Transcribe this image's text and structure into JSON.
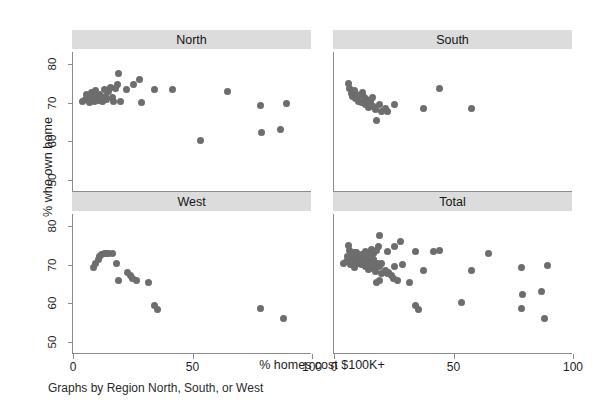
{
  "chart_data": {
    "type": "scatter",
    "title": "",
    "xlabel": "% homes cost $100K+",
    "ylabel": "% who own home",
    "note": "Graphs by Region North, South, or West",
    "xlim": [
      0,
      100
    ],
    "ylim": [
      47,
      83
    ],
    "xticks": [
      0,
      50,
      100
    ],
    "xticklabels": [
      "0",
      "50",
      "100"
    ],
    "yticks": [
      50,
      60,
      70,
      80
    ],
    "yticklabels": [
      "50",
      "60",
      "70",
      "80"
    ],
    "grid": false,
    "legend": "none",
    "marker_color": "#6d6d6d",
    "strip_color": "#dcdcdc",
    "axis_color": "#8c8c8c",
    "panels": [
      {
        "id": "north",
        "label": "North",
        "row": 0,
        "col": 0,
        "points": [
          [
            4.0,
            70.2
          ],
          [
            5.2,
            70.8
          ],
          [
            5.8,
            72.0
          ],
          [
            6.5,
            71.2
          ],
          [
            7.0,
            70.0
          ],
          [
            7.6,
            72.6
          ],
          [
            8.2,
            71.4
          ],
          [
            8.8,
            70.4
          ],
          [
            9.5,
            73.0
          ],
          [
            10.0,
            71.8
          ],
          [
            10.6,
            70.6
          ],
          [
            11.2,
            72.2
          ],
          [
            11.8,
            71.0
          ],
          [
            12.4,
            70.2
          ],
          [
            13.0,
            73.4
          ],
          [
            13.6,
            71.6
          ],
          [
            14.2,
            70.8
          ],
          [
            15.0,
            72.8
          ],
          [
            15.8,
            74.0
          ],
          [
            16.4,
            71.2
          ],
          [
            17.0,
            70.4
          ],
          [
            17.8,
            73.6
          ],
          [
            18.6,
            74.6
          ],
          [
            19.2,
            77.5
          ],
          [
            20.0,
            70.2
          ],
          [
            22.5,
            73.4
          ],
          [
            25.5,
            74.6
          ],
          [
            28.0,
            76.0
          ],
          [
            28.6,
            69.9
          ],
          [
            34.0,
            73.4
          ],
          [
            41.5,
            73.3
          ],
          [
            53.5,
            60.2
          ],
          [
            64.5,
            72.8
          ],
          [
            78.5,
            69.2
          ],
          [
            79.0,
            62.3
          ],
          [
            87.0,
            63.0
          ],
          [
            89.5,
            69.8
          ]
        ]
      },
      {
        "id": "south",
        "label": "South",
        "row": 0,
        "col": 1,
        "points": [
          [
            6.0,
            74.8
          ],
          [
            6.6,
            73.6
          ],
          [
            7.2,
            72.4
          ],
          [
            7.8,
            71.6
          ],
          [
            8.4,
            73.0
          ],
          [
            9.0,
            71.0
          ],
          [
            9.6,
            72.2
          ],
          [
            10.2,
            70.4
          ],
          [
            10.8,
            71.8
          ],
          [
            11.4,
            70.0
          ],
          [
            12.0,
            72.6
          ],
          [
            12.6,
            71.2
          ],
          [
            13.2,
            69.6
          ],
          [
            13.8,
            70.8
          ],
          [
            14.4,
            68.8
          ],
          [
            15.2,
            70.2
          ],
          [
            16.0,
            71.4
          ],
          [
            16.6,
            69.0
          ],
          [
            17.4,
            68.2
          ],
          [
            17.8,
            65.4
          ],
          [
            19.2,
            69.4
          ],
          [
            20.0,
            67.8
          ],
          [
            21.5,
            68.4
          ],
          [
            22.5,
            67.6
          ],
          [
            25.5,
            69.6
          ],
          [
            37.5,
            68.6
          ],
          [
            44.0,
            73.6
          ],
          [
            57.5,
            68.6
          ]
        ]
      },
      {
        "id": "west",
        "label": "West",
        "row": 1,
        "col": 0,
        "points": [
          [
            8.5,
            69.2
          ],
          [
            9.5,
            70.4
          ],
          [
            10.5,
            71.4
          ],
          [
            11.2,
            72.2
          ],
          [
            12.0,
            72.6
          ],
          [
            13.0,
            72.8
          ],
          [
            14.0,
            72.9
          ],
          [
            15.0,
            72.9
          ],
          [
            16.5,
            72.8
          ],
          [
            18.0,
            70.2
          ],
          [
            19.0,
            65.9
          ],
          [
            23.0,
            68.0
          ],
          [
            24.0,
            67.2
          ],
          [
            25.0,
            66.4
          ],
          [
            26.5,
            66.0
          ],
          [
            31.5,
            65.4
          ],
          [
            34.0,
            59.4
          ],
          [
            35.5,
            58.4
          ],
          [
            78.5,
            58.6
          ],
          [
            88.0,
            56.1
          ]
        ]
      },
      {
        "id": "total",
        "label": "Total",
        "row": 1,
        "col": 1,
        "points": [
          [
            4.0,
            70.2
          ],
          [
            5.2,
            70.8
          ],
          [
            5.8,
            72.0
          ],
          [
            6.0,
            74.8
          ],
          [
            6.5,
            71.2
          ],
          [
            6.6,
            73.6
          ],
          [
            7.0,
            70.0
          ],
          [
            7.2,
            72.4
          ],
          [
            7.6,
            72.6
          ],
          [
            7.8,
            71.6
          ],
          [
            8.2,
            71.4
          ],
          [
            8.4,
            73.0
          ],
          [
            8.5,
            69.2
          ],
          [
            8.8,
            70.4
          ],
          [
            9.0,
            71.0
          ],
          [
            9.5,
            73.0
          ],
          [
            9.5,
            70.4
          ],
          [
            9.6,
            72.2
          ],
          [
            10.0,
            71.8
          ],
          [
            10.2,
            70.4
          ],
          [
            10.5,
            71.4
          ],
          [
            10.6,
            70.6
          ],
          [
            10.8,
            71.8
          ],
          [
            11.2,
            72.2
          ],
          [
            11.2,
            72.2
          ],
          [
            11.4,
            70.0
          ],
          [
            11.8,
            71.0
          ],
          [
            12.0,
            72.6
          ],
          [
            12.0,
            72.6
          ],
          [
            12.4,
            70.2
          ],
          [
            12.6,
            71.2
          ],
          [
            13.0,
            73.4
          ],
          [
            13.0,
            72.8
          ],
          [
            13.2,
            69.6
          ],
          [
            13.6,
            71.6
          ],
          [
            13.8,
            70.8
          ],
          [
            14.0,
            72.9
          ],
          [
            14.2,
            70.8
          ],
          [
            14.4,
            68.8
          ],
          [
            15.0,
            72.8
          ],
          [
            15.0,
            72.9
          ],
          [
            15.2,
            70.2
          ],
          [
            15.8,
            74.0
          ],
          [
            16.0,
            71.4
          ],
          [
            16.4,
            71.2
          ],
          [
            16.5,
            72.8
          ],
          [
            16.6,
            69.0
          ],
          [
            17.0,
            70.4
          ],
          [
            17.4,
            68.2
          ],
          [
            17.8,
            73.6
          ],
          [
            17.8,
            65.4
          ],
          [
            18.0,
            70.2
          ],
          [
            18.6,
            74.6
          ],
          [
            19.0,
            65.9
          ],
          [
            19.2,
            77.5
          ],
          [
            19.2,
            69.4
          ],
          [
            20.0,
            70.2
          ],
          [
            20.0,
            67.8
          ],
          [
            21.5,
            68.4
          ],
          [
            22.5,
            73.4
          ],
          [
            22.5,
            67.6
          ],
          [
            23.0,
            68.0
          ],
          [
            24.0,
            67.2
          ],
          [
            25.0,
            66.4
          ],
          [
            25.5,
            74.6
          ],
          [
            25.5,
            69.6
          ],
          [
            26.5,
            66.0
          ],
          [
            28.0,
            76.0
          ],
          [
            28.6,
            69.9
          ],
          [
            31.5,
            65.4
          ],
          [
            34.0,
            73.4
          ],
          [
            34.0,
            59.4
          ],
          [
            35.5,
            58.4
          ],
          [
            37.5,
            68.6
          ],
          [
            41.5,
            73.3
          ],
          [
            44.0,
            73.6
          ],
          [
            53.5,
            60.2
          ],
          [
            57.5,
            68.6
          ],
          [
            64.5,
            72.8
          ],
          [
            78.5,
            69.2
          ],
          [
            78.5,
            58.6
          ],
          [
            79.0,
            62.3
          ],
          [
            87.0,
            63.0
          ],
          [
            88.0,
            56.1
          ],
          [
            89.5,
            69.8
          ]
        ]
      }
    ]
  }
}
